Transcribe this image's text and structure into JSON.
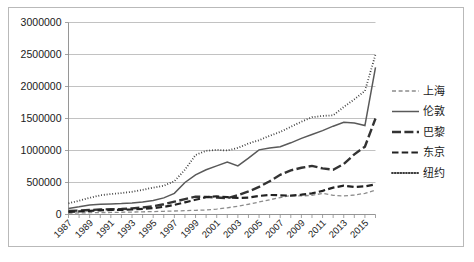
{
  "chart_data": {
    "type": "line",
    "title": "",
    "subtitle": "",
    "xlabel": "",
    "ylabel": "",
    "ylim": [
      0,
      3000000
    ],
    "xlim": [
      1987,
      2016
    ],
    "grid": true,
    "legend_position": "right",
    "y_ticks": [
      "0",
      "500000",
      "1000000",
      "1500000",
      "2000000",
      "2500000",
      "3000000"
    ],
    "y_tick_values": [
      0,
      500000,
      1000000,
      1500000,
      2000000,
      2500000,
      3000000
    ],
    "x_tick_labels": [
      "1987",
      "1989",
      "1991",
      "1993",
      "1995",
      "1997",
      "1999",
      "2001",
      "2003",
      "2005",
      "2007",
      "2009",
      "2011",
      "2013",
      "2015"
    ],
    "x_all_years": [
      1987,
      1988,
      1989,
      1990,
      1991,
      1992,
      1993,
      1994,
      1995,
      1996,
      1997,
      1998,
      1999,
      2000,
      2001,
      2002,
      2003,
      2004,
      2005,
      2006,
      2007,
      2008,
      2009,
      2010,
      2011,
      2012,
      2013,
      2014,
      2015,
      2016
    ],
    "series": [
      {
        "name": "上海",
        "style": "short-dash",
        "color": "#8c8c8c",
        "values": [
          20000,
          25000,
          28000,
          30000,
          32000,
          35000,
          38000,
          42000,
          45000,
          50000,
          55000,
          60000,
          65000,
          70000,
          85000,
          105000,
          130000,
          160000,
          195000,
          230000,
          265000,
          295000,
          290000,
          300000,
          330000,
          300000,
          290000,
          305000,
          330000,
          380000
        ]
      },
      {
        "name": "伦敦",
        "style": "solid",
        "color": "#595959",
        "values": [
          95000,
          120000,
          150000,
          160000,
          165000,
          170000,
          180000,
          195000,
          220000,
          260000,
          330000,
          500000,
          620000,
          700000,
          760000,
          820000,
          760000,
          880000,
          1010000,
          1040000,
          1060000,
          1120000,
          1190000,
          1250000,
          1310000,
          1380000,
          1440000,
          1430000,
          1390000,
          2300000
        ]
      },
      {
        "name": "巴黎",
        "style": "long-dash",
        "color": "#333333",
        "values": [
          55000,
          62000,
          70000,
          78000,
          82000,
          85000,
          95000,
          110000,
          130000,
          160000,
          200000,
          240000,
          280000,
          275000,
          265000,
          255000,
          300000,
          360000,
          430000,
          520000,
          620000,
          690000,
          730000,
          760000,
          720000,
          700000,
          790000,
          940000,
          1060000,
          1500000
        ]
      },
      {
        "name": "东京",
        "style": "medium-dash",
        "color": "#222222",
        "values": [
          40000,
          48000,
          58000,
          66000,
          70000,
          72000,
          78000,
          88000,
          100000,
          120000,
          150000,
          190000,
          230000,
          270000,
          285000,
          270000,
          258000,
          265000,
          290000,
          305000,
          300000,
          295000,
          310000,
          330000,
          370000,
          420000,
          450000,
          430000,
          440000,
          470000
        ]
      },
      {
        "name": "纽约",
        "style": "dotted",
        "color": "#3a3a3a",
        "values": [
          175000,
          215000,
          260000,
          300000,
          320000,
          335000,
          355000,
          385000,
          420000,
          450000,
          520000,
          700000,
          930000,
          995000,
          1010000,
          1000000,
          1040000,
          1110000,
          1160000,
          1230000,
          1290000,
          1370000,
          1450000,
          1520000,
          1540000,
          1550000,
          1680000,
          1800000,
          1930000,
          2500000
        ]
      }
    ]
  },
  "legend": {
    "items": [
      {
        "label": "上海",
        "style": "short-dash"
      },
      {
        "label": "伦敦",
        "style": "solid"
      },
      {
        "label": "巴黎",
        "style": "long-dash"
      },
      {
        "label": "东京",
        "style": "medium-dash"
      },
      {
        "label": "纽约",
        "style": "dotted"
      }
    ]
  },
  "colors": {
    "background": "#ffffff",
    "frame_border": "#b9b9b9",
    "gridline": "#b3b3b3",
    "axis": "#8a8a8a",
    "text": "#1a1a1a"
  }
}
